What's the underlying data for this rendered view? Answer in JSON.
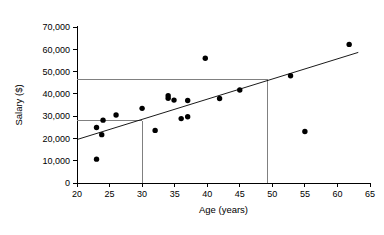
{
  "chart_data": {
    "type": "scatter",
    "title": "",
    "xlabel": "Age (years)",
    "ylabel": "Salary ($)",
    "xlim": [
      20,
      65
    ],
    "ylim": [
      0,
      70000
    ],
    "xticks": [
      20,
      25,
      30,
      35,
      40,
      45,
      50,
      55,
      60,
      65
    ],
    "xtick_labels": [
      "20",
      "25",
      "30",
      "35",
      "40",
      "45",
      "50",
      "55",
      "60",
      "65"
    ],
    "yticks": [
      0,
      10000,
      20000,
      30000,
      40000,
      50000,
      60000,
      70000
    ],
    "ytick_labels": [
      "0",
      "10,000",
      "20,000",
      "30,000",
      "40,000",
      "50,000",
      "60,000",
      "70,000"
    ],
    "grid": false,
    "legend": null,
    "points": [
      {
        "x": 23.0,
        "y": 10700
      },
      {
        "x": 23.0,
        "y": 24900
      },
      {
        "x": 23.8,
        "y": 21700
      },
      {
        "x": 24.0,
        "y": 28200
      },
      {
        "x": 26.0,
        "y": 30500
      },
      {
        "x": 30.0,
        "y": 33500
      },
      {
        "x": 32.0,
        "y": 23600
      },
      {
        "x": 34.0,
        "y": 39200
      },
      {
        "x": 34.0,
        "y": 38000
      },
      {
        "x": 34.9,
        "y": 37200
      },
      {
        "x": 36.0,
        "y": 28900
      },
      {
        "x": 37.0,
        "y": 29700
      },
      {
        "x": 37.0,
        "y": 37000
      },
      {
        "x": 39.7,
        "y": 56000
      },
      {
        "x": 41.9,
        "y": 37900
      },
      {
        "x": 45.0,
        "y": 41700
      },
      {
        "x": 52.8,
        "y": 48100
      },
      {
        "x": 55.0,
        "y": 23100
      },
      {
        "x": 61.8,
        "y": 62200
      }
    ],
    "trend_line": {
      "label": "regression-line",
      "x_start": 20.0,
      "y_start": 19500,
      "x_end": 63.2,
      "y_end": 58600
    },
    "reference_lines": [
      {
        "label": "upper-horizontal-reference",
        "orientation": "horizontal",
        "value": 46500,
        "from_x": 20.0,
        "to_x": 49.3
      },
      {
        "label": "lower-horizontal-reference",
        "orientation": "horizontal",
        "value": 28000,
        "from_x": 20.0,
        "to_x": 30.0
      },
      {
        "label": "age-30-vertical-reference",
        "orientation": "vertical",
        "value": 30.0,
        "from_y": 0,
        "to_y": 28000
      },
      {
        "label": "age-49-vertical-reference",
        "orientation": "vertical",
        "value": 49.3,
        "from_y": 0,
        "to_y": 46500
      }
    ],
    "colors": {
      "point": "#000000",
      "trend_line": "#000000",
      "reference_line": "#808080",
      "axis": "#000000",
      "background": "#ffffff"
    }
  }
}
